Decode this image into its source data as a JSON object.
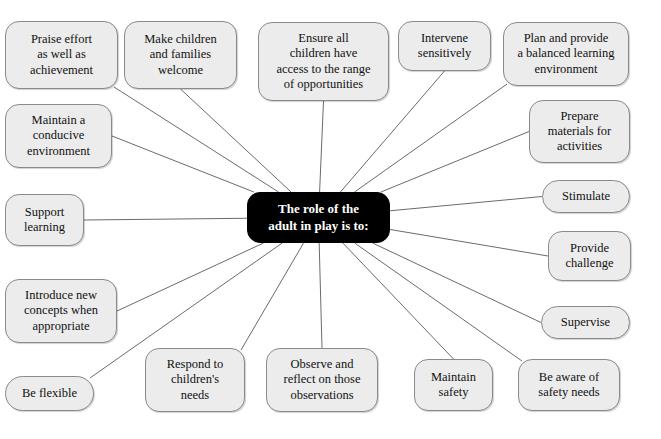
{
  "diagram": {
    "type": "mind-map",
    "title": "The role of the adult in play is to:",
    "background_color": "#ffffff",
    "center_node": {
      "label": "The role of the\nadult in play is to:",
      "fill_color": "#000000",
      "text_color": "#ffffff",
      "x": 247,
      "y": 192,
      "w": 143,
      "h": 51
    },
    "node_style": {
      "fill_color": "#ececec",
      "border_color": "#8a8a8a",
      "text_color": "#111111",
      "edge_color": "#6b6b6b"
    },
    "nodes": [
      {
        "id": "praise-effort",
        "label": "Praise effort\nas well as\nachievement",
        "x": 5,
        "y": 21,
        "w": 113,
        "h": 68,
        "anchor": "br",
        "pill": false
      },
      {
        "id": "make-welcome",
        "label": "Make children\nand families\nwelcome",
        "x": 124,
        "y": 21,
        "w": 113,
        "h": 68,
        "anchor": "bc",
        "pill": false
      },
      {
        "id": "ensure-access",
        "label": "Ensure all\nchildren have\naccess to the range\nof opportunities",
        "x": 258,
        "y": 22,
        "w": 131,
        "h": 79,
        "anchor": "bc",
        "pill": false
      },
      {
        "id": "intervene",
        "label": "Intervene\nsensitively",
        "x": 398,
        "y": 21,
        "w": 93,
        "h": 50,
        "anchor": "bc",
        "pill": false
      },
      {
        "id": "plan-provide",
        "label": "Plan and provide\na balanced learning\nenvironment",
        "x": 503,
        "y": 22,
        "w": 126,
        "h": 64,
        "anchor": "bl",
        "pill": false
      },
      {
        "id": "prepare-materials",
        "label": "Prepare\nmaterials for\nactivities",
        "x": 529,
        "y": 100,
        "w": 101,
        "h": 63,
        "anchor": "lc",
        "pill": false
      },
      {
        "id": "stimulate",
        "label": "Stimulate",
        "x": 542,
        "y": 180,
        "w": 88,
        "h": 33,
        "anchor": "lc",
        "pill": true
      },
      {
        "id": "provide-challenge",
        "label": "Provide\nchallenge",
        "x": 548,
        "y": 231,
        "w": 83,
        "h": 50,
        "anchor": "lc",
        "pill": false
      },
      {
        "id": "supervise",
        "label": "Supervise",
        "x": 541,
        "y": 306,
        "w": 89,
        "h": 33,
        "anchor": "lc",
        "pill": true
      },
      {
        "id": "be-aware-safety",
        "label": "Be aware of\nsafety needs",
        "x": 518,
        "y": 359,
        "w": 102,
        "h": 52,
        "anchor": "tl",
        "pill": false
      },
      {
        "id": "maintain-safety",
        "label": "Maintain\nsafety",
        "x": 414,
        "y": 359,
        "w": 79,
        "h": 52,
        "anchor": "tc",
        "pill": false
      },
      {
        "id": "observe-reflect",
        "label": "Observe and\nreflect on those\nobservations",
        "x": 266,
        "y": 348,
        "w": 112,
        "h": 64,
        "anchor": "tc",
        "pill": false
      },
      {
        "id": "respond-needs",
        "label": "Respond to\nchildren's\nneeds",
        "x": 145,
        "y": 348,
        "w": 100,
        "h": 64,
        "anchor": "tr",
        "pill": false
      },
      {
        "id": "be-flexible",
        "label": "Be flexible",
        "x": 5,
        "y": 376,
        "w": 89,
        "h": 35,
        "anchor": "tr",
        "pill": true
      },
      {
        "id": "introduce-concepts",
        "label": "Introduce new\nconcepts when\nappropriate",
        "x": 5,
        "y": 279,
        "w": 112,
        "h": 64,
        "anchor": "rc",
        "pill": false
      },
      {
        "id": "support-learning",
        "label": "Support\nlearning",
        "x": 5,
        "y": 194,
        "w": 79,
        "h": 52,
        "anchor": "rc",
        "pill": false
      },
      {
        "id": "maintain-conducive",
        "label": "Maintain a\nconducive\nenvironment",
        "x": 5,
        "y": 104,
        "w": 107,
        "h": 64,
        "anchor": "rc",
        "pill": false
      }
    ],
    "edges": [
      {
        "from": "praise-effort",
        "to": "center"
      },
      {
        "from": "make-welcome",
        "to": "center"
      },
      {
        "from": "ensure-access",
        "to": "center"
      },
      {
        "from": "intervene",
        "to": "center"
      },
      {
        "from": "plan-provide",
        "to": "center"
      },
      {
        "from": "prepare-materials",
        "to": "center"
      },
      {
        "from": "stimulate",
        "to": "center"
      },
      {
        "from": "provide-challenge",
        "to": "center"
      },
      {
        "from": "supervise",
        "to": "center"
      },
      {
        "from": "be-aware-safety",
        "to": "center"
      },
      {
        "from": "maintain-safety",
        "to": "center"
      },
      {
        "from": "observe-reflect",
        "to": "center"
      },
      {
        "from": "respond-needs",
        "to": "center"
      },
      {
        "from": "be-flexible",
        "to": "center"
      },
      {
        "from": "introduce-concepts",
        "to": "center"
      },
      {
        "from": "support-learning",
        "to": "center"
      },
      {
        "from": "maintain-conducive",
        "to": "center"
      }
    ]
  }
}
